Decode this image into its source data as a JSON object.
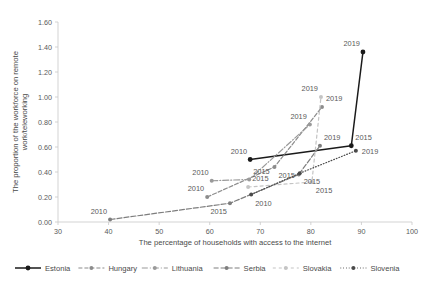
{
  "chart_data": {
    "type": "line",
    "title": "",
    "xlabel": "The percentage of households with access to the internet",
    "ylabel": "The proportion of the workforce on remote work/teleworking",
    "xlim": [
      30,
      100
    ],
    "ylim": [
      0.0,
      1.6
    ],
    "xticks": [
      "30",
      "40",
      "50",
      "60",
      "70",
      "80",
      "90",
      "100"
    ],
    "yticks": [
      "0.00",
      "0.20",
      "0.40",
      "0.60",
      "0.80",
      "1.00",
      "1.20",
      "1.40",
      "1.60"
    ],
    "grid": false,
    "legend_position": "bottom",
    "series": [
      {
        "name": "Estonia",
        "color": "#1a1a1a",
        "dash": "none",
        "marker": "circle",
        "x": [
          68.0,
          88.0,
          90.3
        ],
        "y": [
          0.5,
          0.61,
          1.36
        ],
        "labels": [
          "2010",
          "2015",
          "2019"
        ],
        "label_pos": [
          "above-left",
          "above-right",
          "above-left"
        ]
      },
      {
        "name": "Hungary",
        "color": "#8c8c8c",
        "dash": "4,2",
        "marker": "circle",
        "x": [
          59.5,
          72.8,
          82.2
        ],
        "y": [
          0.2,
          0.44,
          0.92
        ],
        "labels": [
          "2010",
          "2015",
          "2019"
        ],
        "label_pos": [
          "above-left",
          "below-right",
          "above-right"
        ]
      },
      {
        "name": "Lithuania",
        "color": "#9a9a9a",
        "dash": "6,2,1,2",
        "marker": "circle",
        "x": [
          60.4,
          67.8,
          79.8
        ],
        "y": [
          0.33,
          0.34,
          0.78
        ],
        "labels": [
          "2010",
          "2015",
          "2019"
        ],
        "label_pos": [
          "above-left",
          "above-right",
          "above-left"
        ]
      },
      {
        "name": "Serbia",
        "color": "#7e7e7e",
        "dash": "5,2",
        "marker": "circle",
        "x": [
          40.3,
          64.0,
          77.6,
          81.8
        ],
        "y": [
          0.02,
          0.15,
          0.38,
          0.61
        ],
        "labels": [
          "2010",
          "2015",
          "",
          "2019"
        ],
        "label_pos": [
          "above-left",
          "below-left",
          "",
          "above-right"
        ]
      },
      {
        "name": "Slovakia",
        "color": "#c4c4c4",
        "dash": "3,3",
        "marker": "circle",
        "x": [
          67.6,
          80.2,
          82.0
        ],
        "y": [
          0.28,
          0.32,
          1.0
        ],
        "labels": [
          "2015",
          "2015",
          "2019"
        ],
        "label_pos": [
          "above-right",
          "below-right",
          "above-left"
        ]
      },
      {
        "name": "Slovenia",
        "color": "#4a4a4a",
        "dash": "0.8,2",
        "marker": "circle",
        "x": [
          68.2,
          77.8,
          88.9
        ],
        "y": [
          0.22,
          0.39,
          0.57
        ],
        "labels": [
          "2010",
          "2015",
          "2019"
        ],
        "label_pos": [
          "below-right",
          "below-right",
          "right"
        ]
      }
    ],
    "legend_entries": [
      {
        "label": "Estonia",
        "color": "#1a1a1a",
        "dash": "none"
      },
      {
        "label": "Hungary",
        "color": "#8c8c8c",
        "dash": "4,2"
      },
      {
        "label": "Lithuania",
        "color": "#9a9a9a",
        "dash": "6,2,1,2"
      },
      {
        "label": "Serbia",
        "color": "#7e7e7e",
        "dash": "5,2"
      },
      {
        "label": "Slovakia",
        "color": "#c4c4c4",
        "dash": "3,3"
      },
      {
        "label": "Slovenia",
        "color": "#4a4a4a",
        "dash": "0.8,2"
      }
    ]
  }
}
